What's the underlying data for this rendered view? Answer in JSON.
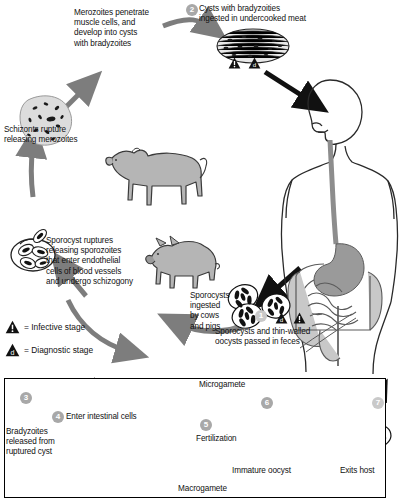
{
  "diagram": {
    "background_color": "#ffffff",
    "ink_color": "#000000",
    "fill_gray": "#a8a8a8",
    "badge_color": "#a8a8a8"
  },
  "labels": {
    "merozoites_penetrate": "Merozoites penetrate\nmuscle cells, and\ndevelop into cysts\nwith bradyzoites",
    "cysts_ingested": "Cysts with bradyzoities\ningested in undercooked meat",
    "schizonts_rupture": "Schizonts rupture\nreleasing merozoites",
    "sporocyst_ruptures": "Sporocyst ruptures\nreleasing sporozoites\nthat enter endothelial\ncells of blood vessels\nand undergo schizogony",
    "sporocysts_ingested": "Sporocysts\ningested\nby cows\nand pigs",
    "sporocysts_passed": "Sporocysts and thin-walled\noocysts passed in feces",
    "bradyzoites_released": "Bradyzoites\nreleased from\nruptured cyst",
    "enter_intestinal_cells": "Enter intestinal cells",
    "microgamete": "Microgamete",
    "macrogamete": "Macrogamete",
    "fertilization": "Fertilization",
    "immature_oocyst": "Immature oocyst",
    "exits_host": "Exits host"
  },
  "legend": {
    "infective": "= Infective stage",
    "diagnostic": "= Diagnostic stage",
    "infective_symbol": "!",
    "diagnostic_symbol": "d"
  },
  "steps": {
    "one": "1",
    "two": "2",
    "three": "3",
    "four": "4",
    "five": "5",
    "six": "6",
    "seven": "7"
  },
  "markers": {
    "meat_infective": "!",
    "meat_diagnostic": "d",
    "feces_diagnostic": "d",
    "feces_infective": "!"
  }
}
